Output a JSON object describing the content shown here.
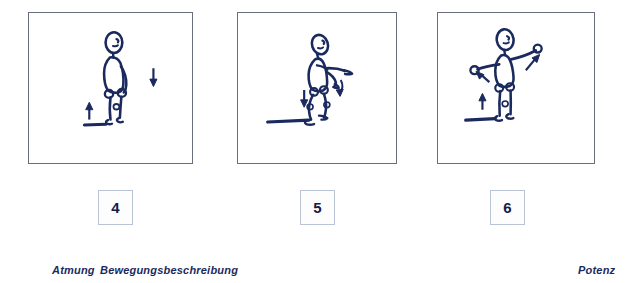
{
  "document": {
    "type": "exercise-illustration-sheet",
    "ink_color": "#1b2a5e",
    "frame_color": "#6b6f7d",
    "number_box_border_color": "#b9c4d4",
    "background": "#ffffff"
  },
  "panels": [
    {
      "number": "4",
      "figure_name": "stick-figure-standing-upright",
      "description": "Stick figure standing upright, arms at sides, facing right",
      "arrows": [
        {
          "name": "arrow-down-right-of-figure",
          "direction": "down"
        },
        {
          "name": "arrow-up-left-of-feet",
          "direction": "up"
        }
      ],
      "ground_line": true
    },
    {
      "number": "5",
      "figure_name": "stick-figure-crouching-arms-forward",
      "description": "Stick figure crouching with knees bent, arms extended forward and downward",
      "arrows": [
        {
          "name": "arrow-down-left-of-figure",
          "direction": "down"
        },
        {
          "name": "arrow-curve-down-at-hand",
          "direction": "down-curve"
        }
      ],
      "ground_line": true
    },
    {
      "number": "6",
      "figure_name": "stick-figure-arms-spread-wide",
      "description": "Stick figure standing with both arms spread out wide, one raised",
      "arrows": [
        {
          "name": "arrow-up-right-at-right-hand",
          "direction": "up-right"
        },
        {
          "name": "arrow-down-left-at-left-hand",
          "direction": "down-left"
        },
        {
          "name": "arrow-up-left-of-feet",
          "direction": "up"
        }
      ],
      "ground_line": true
    }
  ],
  "captions": {
    "breathing_label": "Atmung",
    "movement_label": "Bewegungsbeschreibung",
    "potency_label": "Potenz"
  }
}
